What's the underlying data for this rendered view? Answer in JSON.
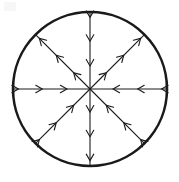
{
  "figure": {
    "background_color": "#ffffff",
    "stroke_color": "#1a1a1a",
    "circle": {
      "center_x": 90,
      "center_y": 89,
      "radius": 77,
      "stroke_width": 2.6
    },
    "ray_defaults": {
      "stroke_width": 1.1,
      "arrowheads_per_ray": 3,
      "arrow_size": 7.5,
      "arrow_spread_deg": 30,
      "arrow_stroke_width": 1.1,
      "arrow_positions": [
        0.3,
        0.62,
        0.93
      ]
    },
    "rays": [
      {
        "name": "ray-east",
        "angle_deg": 0,
        "arrow_direction": "inward",
        "arrow_points_toward": "center",
        "label": "right horizontal"
      },
      {
        "name": "ray-northeast",
        "angle_deg": 45,
        "arrow_direction": "outward",
        "arrow_points_toward": "rim",
        "label": "upper-right diagonal"
      },
      {
        "name": "ray-north",
        "angle_deg": 90,
        "arrow_direction": "inward",
        "arrow_points_toward": "center",
        "label": "top vertical"
      },
      {
        "name": "ray-northwest",
        "angle_deg": 135,
        "arrow_direction": "outward",
        "arrow_points_toward": "rim",
        "label": "upper-left diagonal"
      },
      {
        "name": "ray-west",
        "angle_deg": 180,
        "arrow_direction": "inward",
        "arrow_points_toward": "center",
        "label": "left horizontal"
      },
      {
        "name": "ray-southwest",
        "angle_deg": 225,
        "arrow_direction": "inward",
        "arrow_points_toward": "center",
        "label": "lower-left diagonal"
      },
      {
        "name": "ray-south",
        "angle_deg": 270,
        "arrow_direction": "outward",
        "arrow_points_toward": "rim",
        "label": "bottom vertical"
      },
      {
        "name": "ray-southeast",
        "angle_deg": 315,
        "arrow_direction": "inward",
        "arrow_points_toward": "center",
        "label": "lower-right diagonal"
      }
    ]
  }
}
